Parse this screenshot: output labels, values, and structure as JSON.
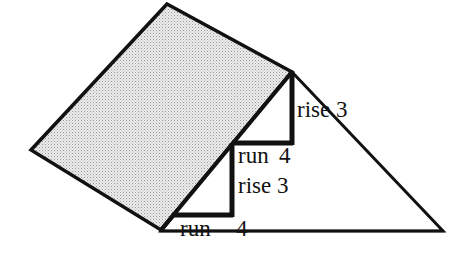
{
  "diagram": {
    "title": "",
    "colors": {
      "stroke": "#111111",
      "shade_fill": "#d9d9d9",
      "background": "#ffffff"
    },
    "shapes": {
      "shaded_parallelogram": {
        "points": [
          [
            167,
            4
          ],
          [
            292,
            72
          ],
          [
            161,
            230
          ],
          [
            31,
            150
          ]
        ]
      },
      "triangle": {
        "points": [
          [
            292,
            72
          ],
          [
            443,
            231
          ],
          [
            161,
            231
          ]
        ]
      },
      "upper_step": {
        "run": [
          [
            232,
            143
          ],
          [
            292,
            143
          ]
        ],
        "rise": [
          [
            292,
            143
          ],
          [
            292,
            72
          ]
        ]
      },
      "lower_step": {
        "run": [
          [
            172,
            215
          ],
          [
            232,
            215
          ]
        ],
        "rise": [
          [
            232,
            215
          ],
          [
            232,
            145
          ]
        ]
      }
    },
    "labels": {
      "upper_rise": "rise 3",
      "upper_run_word": "run",
      "upper_run_value": "4",
      "lower_rise": "rise 3",
      "lower_run_word": "run",
      "lower_run_value": "4"
    }
  }
}
